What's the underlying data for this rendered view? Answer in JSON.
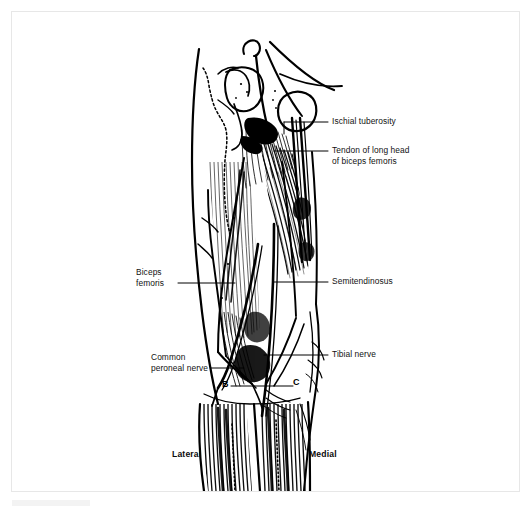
{
  "figure": {
    "type": "anatomical-illustration",
    "view": "posterior",
    "background_color": "#ffffff",
    "ink_color": "#000000",
    "frame_color": "#e7e7e7"
  },
  "labels": {
    "ischial_tuberosity": "Ischial tuberosity",
    "tendon_long_head": "Tendon of long head\nof biceps femoris",
    "biceps_femoris": "Biceps\nfemoris",
    "semitendinosus": "Semitendinosus",
    "common_peroneal_nerve": "Common\nperoneal nerve",
    "tibial_nerve": "Tibial nerve"
  },
  "orientation": {
    "lateral": "Lateral",
    "medial": "Medial"
  },
  "markers": {
    "b": "B",
    "c": "C"
  }
}
